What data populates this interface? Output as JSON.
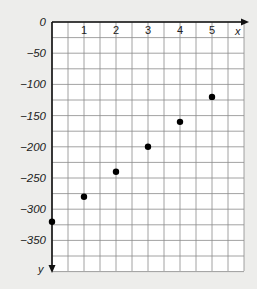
{
  "chart_data": {
    "type": "scatter",
    "title": "",
    "xlabel": "x",
    "ylabel": "y",
    "x_ticks": [
      "1",
      "2",
      "3",
      "4",
      "5"
    ],
    "y_ticks": [
      "0",
      "-50",
      "-100",
      "-150",
      "-200",
      "-250",
      "-300",
      "-350"
    ],
    "xlim": [
      0,
      6
    ],
    "ylim": [
      -400,
      0
    ],
    "grid": true,
    "legend": null,
    "series": [
      {
        "name": "points",
        "x": [
          0,
          1,
          2,
          3,
          4,
          5
        ],
        "y": [
          -320,
          -280,
          -240,
          -200,
          -160,
          -120
        ]
      }
    ]
  },
  "colors": {
    "background": "#ededeb",
    "plot_area": "#ffffff",
    "grid": "#8a8a8a",
    "axis": "#111111",
    "points": "#000000"
  }
}
